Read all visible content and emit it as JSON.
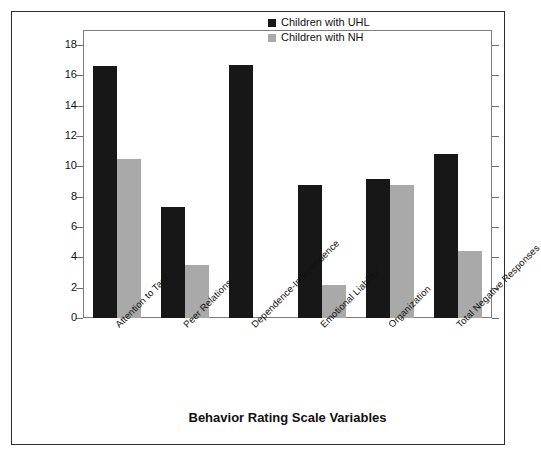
{
  "chart_data": {
    "type": "bar",
    "title": "",
    "xlabel": "Behavior Rating Scale Variables",
    "ylabel": "Negative Responses (%)",
    "ylim": [
      0,
      19
    ],
    "yticks": [
      0,
      2,
      4,
      6,
      8,
      10,
      12,
      14,
      16,
      18
    ],
    "ytick_labels": [
      "0",
      "2",
      "4",
      "6",
      "8",
      "10",
      "12",
      "14",
      "16",
      "18"
    ],
    "grid": false,
    "legend_position": "top-right",
    "categories": [
      "Attention to Task",
      "Peer Relations",
      "Dependence-Independence",
      "Emotional Liability",
      "Organization",
      "Total Negative Responses"
    ],
    "series": [
      {
        "name": "Children with UHL",
        "color": "#171717",
        "values": [
          16.6,
          7.3,
          16.7,
          8.8,
          9.2,
          10.8
        ]
      },
      {
        "name": "Children with NH",
        "color": "#a9a9a9",
        "values": [
          10.5,
          3.5,
          0,
          2.2,
          8.8,
          4.4
        ]
      }
    ]
  },
  "legend": {
    "items": [
      {
        "label": "Children with UHL",
        "color": "#171717"
      },
      {
        "label": "Children with NH",
        "color": "#a9a9a9"
      }
    ]
  },
  "colors": {
    "uhl": "#171717",
    "nh": "#a9a9a9",
    "axis": "#7d7d7d",
    "frame": "#2b2b2b",
    "text": "#111111"
  }
}
